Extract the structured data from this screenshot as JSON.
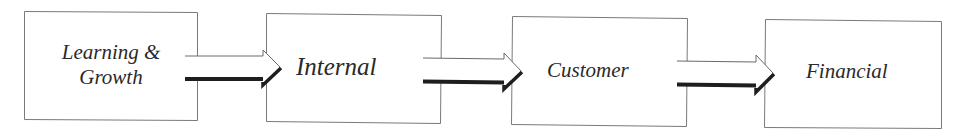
{
  "diagram": {
    "type": "flow",
    "direction": "left-to-right",
    "colors": {
      "background": "#ffffff",
      "box_border": "#7a7a7a",
      "text": "#2a2a2a",
      "arrow_outline": "#6a6a6a",
      "arrow_shadow": "#1e1e1e"
    },
    "nodes": [
      {
        "id": "learning_growth",
        "line1": "Learning &",
        "line2": "Growth"
      },
      {
        "id": "internal",
        "label": "Internal"
      },
      {
        "id": "customer",
        "label": "Customer"
      },
      {
        "id": "financial",
        "label": "Financial"
      }
    ],
    "edges": [
      {
        "from": "learning_growth",
        "to": "internal",
        "icon": "block-arrow-right-icon"
      },
      {
        "from": "internal",
        "to": "customer",
        "icon": "block-arrow-right-icon"
      },
      {
        "from": "customer",
        "to": "financial",
        "icon": "block-arrow-right-icon"
      }
    ]
  }
}
